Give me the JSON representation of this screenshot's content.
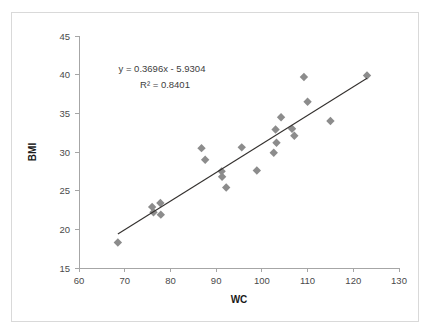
{
  "chart_data": {
    "type": "scatter",
    "title": "",
    "xlabel": "WC",
    "ylabel": "BMI",
    "xlim": [
      60,
      130
    ],
    "ylim": [
      15,
      45
    ],
    "xticks": [
      60,
      70,
      80,
      90,
      100,
      110,
      120,
      130
    ],
    "yticks": [
      15,
      20,
      25,
      30,
      35,
      40,
      45
    ],
    "grid": false,
    "legend": false,
    "marker_style": "diamond",
    "marker_color": "#8c8c8c",
    "trendline_color": "#33302e",
    "annotations": {
      "equation": "y = 0.3696x - 5.9304",
      "r_squared": "R² = 0.8401"
    },
    "trendline": {
      "slope": 0.3696,
      "intercept": -5.9304,
      "x_start": 68.5,
      "x_end": 123.0
    },
    "points": [
      {
        "x": 68.5,
        "y": 18.3
      },
      {
        "x": 76.0,
        "y": 22.9
      },
      {
        "x": 76.3,
        "y": 22.2
      },
      {
        "x": 77.8,
        "y": 23.4
      },
      {
        "x": 77.9,
        "y": 21.9
      },
      {
        "x": 86.8,
        "y": 30.5
      },
      {
        "x": 87.6,
        "y": 29.0
      },
      {
        "x": 91.2,
        "y": 27.5
      },
      {
        "x": 91.3,
        "y": 26.8
      },
      {
        "x": 92.2,
        "y": 25.4
      },
      {
        "x": 95.6,
        "y": 30.6
      },
      {
        "x": 98.9,
        "y": 27.6
      },
      {
        "x": 102.6,
        "y": 29.9
      },
      {
        "x": 103.0,
        "y": 32.9
      },
      {
        "x": 103.2,
        "y": 31.2
      },
      {
        "x": 104.2,
        "y": 34.5
      },
      {
        "x": 106.6,
        "y": 33.0
      },
      {
        "x": 107.1,
        "y": 32.1
      },
      {
        "x": 109.2,
        "y": 39.7
      },
      {
        "x": 110.0,
        "y": 36.5
      },
      {
        "x": 115.0,
        "y": 34.0
      },
      {
        "x": 123.0,
        "y": 39.9
      }
    ]
  }
}
